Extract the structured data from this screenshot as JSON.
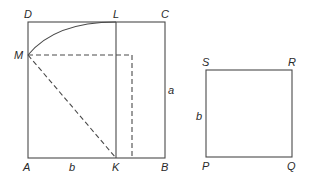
{
  "diagram": {
    "stroke_color": "#4a4a4a",
    "label_color": "#2a2a2a",
    "figure1": {
      "vertices": {
        "A": "A",
        "B": "B",
        "C": "C",
        "D": "D",
        "K": "K",
        "L": "L",
        "M": "M"
      },
      "side_labels": {
        "vertical": "a",
        "bottom": "b"
      }
    },
    "figure2": {
      "vertices": {
        "P": "P",
        "Q": "Q",
        "R": "R",
        "S": "S"
      },
      "side_labels": {
        "left": "b"
      }
    }
  }
}
